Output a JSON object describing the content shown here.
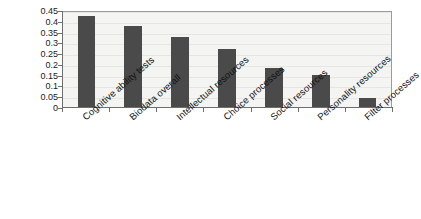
{
  "chart_data": {
    "type": "bar",
    "title": "",
    "subtitle": "",
    "xlabel": "",
    "ylabel": "",
    "categories": [
      "Cognitive ability tests",
      "Biodata overall",
      "Intellectual resources",
      "Choice processes",
      "Social resources",
      "Personality resources",
      "Filter processes"
    ],
    "values": [
      0.42,
      0.375,
      0.325,
      0.27,
      0.18,
      0.15,
      0.04
    ],
    "ylim": [
      0,
      0.45
    ],
    "yticks": [
      "0",
      "0.05",
      "0.1",
      "0.15",
      "0.2",
      "0.25",
      "0.3",
      "0.35",
      "0.4",
      "0.45"
    ],
    "ytick_values": [
      0,
      0.05,
      0.1,
      0.15,
      0.2,
      0.25,
      0.3,
      0.35,
      0.4,
      0.45
    ],
    "grid": true,
    "legend": false,
    "bar_color": "#4a4a4a",
    "plot_background": "#f4f4f2",
    "axis_color": "#6e6e6e"
  }
}
